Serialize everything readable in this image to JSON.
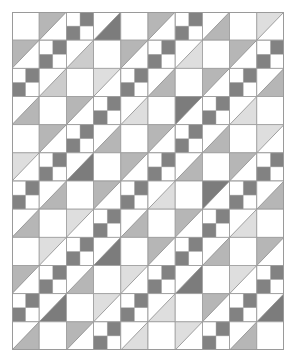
{
  "colors": {
    "background": "#ffffff",
    "grid_line": "#9a9a9a",
    "diagonal_line": "#8a8a8a",
    "d": "#7c7c7c",
    "m": "#b6b6b6",
    "l": "#cccccc",
    "v": "#dedede",
    "four_patch": "#828282"
  },
  "grid": {
    "columns": 10,
    "rows": 12,
    "cell_types_legend": {
      "E": "plain white square",
      "UL": "half-square triangle, upper-left shaded",
      "LR": "half-square triangle, lower-right shaded",
      "FP": "four-patch, top-right and bottom-left dark"
    },
    "cells": [
      [
        "E",
        "UL-m",
        "FP",
        "LR-d",
        "E",
        "UL-m",
        "FP",
        "LR-m",
        "E",
        "UL-v"
      ],
      [
        "UL-m",
        "FP",
        "LR-l",
        "E",
        "UL-m",
        "FP",
        "LR-v",
        "E",
        "UL-m",
        "FP"
      ],
      [
        "FP",
        "LR-l",
        "E",
        "UL-v",
        "FP",
        "LR-m",
        "E",
        "UL-m",
        "FP",
        "LR-m"
      ],
      [
        "LR-m",
        "E",
        "UL-m",
        "FP",
        "LR-v",
        "E",
        "UL-d",
        "FP",
        "LR-v",
        "E"
      ],
      [
        "E",
        "UL-m",
        "FP",
        "LR-m",
        "E",
        "UL-m",
        "FP",
        "LR-m",
        "E",
        "UL-v"
      ],
      [
        "UL-v",
        "FP",
        "LR-d",
        "E",
        "UL-m",
        "FP",
        "LR-m",
        "E",
        "UL-m",
        "FP"
      ],
      [
        "FP",
        "LR-m",
        "E",
        "UL-m",
        "FP",
        "LR-v",
        "E",
        "UL-d",
        "FP",
        "LR-m"
      ],
      [
        "LR-m",
        "E",
        "UL-v",
        "FP",
        "LR-m",
        "E",
        "UL-m",
        "FP",
        "LR-v",
        "E"
      ],
      [
        "E",
        "UL-v",
        "FP",
        "LR-d",
        "E",
        "UL-m",
        "FP",
        "LR-m",
        "E",
        "UL-m"
      ],
      [
        "UL-m",
        "FP",
        "LR-m",
        "E",
        "UL-v",
        "FP",
        "LR-d",
        "E",
        "UL-v",
        "FP"
      ],
      [
        "FP",
        "LR-d",
        "E",
        "UL-v",
        "FP",
        "LR-v",
        "E",
        "UL-m",
        "FP",
        "LR-d"
      ],
      [
        "LR-m",
        "E",
        "UL-m",
        "FP",
        "LR-v",
        "E",
        "UL-v",
        "FP",
        "LR-m",
        "E"
      ]
    ]
  }
}
